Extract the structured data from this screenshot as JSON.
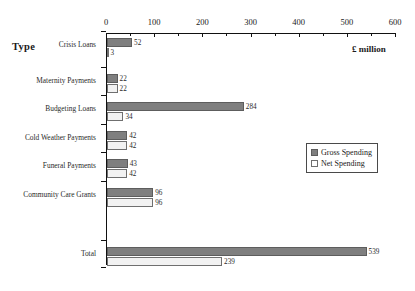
{
  "chart_data": {
    "type": "bar",
    "orientation": "horizontal",
    "title": "",
    "xlabel": "£ million",
    "ylabel": "Type",
    "xlim": [
      0,
      600
    ],
    "xticks": [
      0,
      100,
      200,
      300,
      400,
      500,
      600
    ],
    "xtick_labels": [
      "0",
      "100",
      "200",
      "300",
      "400",
      "500",
      "600"
    ],
    "minor_tick_step": 50,
    "grid": false,
    "legend_position": "center-right",
    "categories": [
      "Crisis Loans",
      "Maternity Payments",
      "Budgeting Loans",
      "Cold Weather Payments",
      "Funeral Payments",
      "Community Care Grants",
      "Total"
    ],
    "series": [
      {
        "name": "Gross Spending",
        "color": "#7f7f7f",
        "values": [
          52,
          22,
          284,
          42,
          43,
          96,
          539
        ]
      },
      {
        "name": "Net Spending",
        "color": "#f2f2f2",
        "values": [
          3,
          22,
          34,
          42,
          42,
          96,
          239
        ]
      }
    ],
    "value_labels": {
      "gross": [
        "52",
        "22",
        "284",
        "42",
        "43",
        "96",
        "539"
      ],
      "net": [
        "3",
        "22",
        "34",
        "42",
        "42",
        "96",
        "239"
      ]
    }
  },
  "legend": {
    "items": [
      {
        "label": "Gross Spending",
        "swatch": "filled-gray"
      },
      {
        "label": "Net Spending",
        "swatch": "outline-white"
      }
    ]
  }
}
